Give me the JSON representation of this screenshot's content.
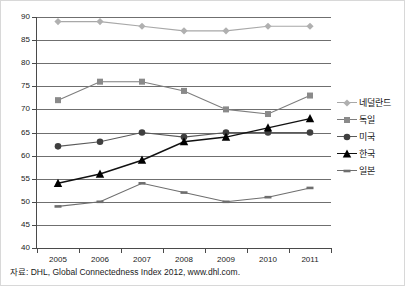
{
  "chart_data": {
    "type": "line",
    "title": "",
    "subtitle": "",
    "xlabel": "",
    "ylabel": "",
    "x": [
      2005,
      2006,
      2007,
      2008,
      2009,
      2010,
      2011
    ],
    "categories": [
      "2005",
      "2006",
      "2007",
      "2008",
      "2009",
      "2010",
      "2011"
    ],
    "ylim": [
      40,
      90
    ],
    "yticks": [
      40,
      45,
      50,
      55,
      60,
      65,
      70,
      75,
      80,
      85,
      90
    ],
    "ytick_labels": [
      "40",
      "45",
      "50",
      "55",
      "60",
      "65",
      "70",
      "75",
      "80",
      "85",
      "90"
    ],
    "grid": true,
    "legend_position": "right",
    "series": [
      {
        "name": "네덜란드",
        "values": [
          89,
          89,
          88,
          87,
          87,
          88,
          88
        ],
        "color": "#a8a8a8",
        "marker": "diamond",
        "marker_color": "#b0b0b0"
      },
      {
        "name": "독일",
        "values": [
          72,
          76,
          76,
          74,
          70,
          69,
          73
        ],
        "color": "#7d7d7d",
        "marker": "square",
        "marker_color": "#8a8a8a"
      },
      {
        "name": "미국",
        "values": [
          62,
          63,
          65,
          64,
          65,
          65,
          65
        ],
        "color": "#5a5a5a",
        "marker": "circle",
        "marker_color": "#3f3f3f"
      },
      {
        "name": "한국",
        "values": [
          54,
          56,
          59,
          63,
          64,
          66,
          68
        ],
        "color": "#111111",
        "marker": "triangle",
        "marker_color": "#000000"
      },
      {
        "name": "일본",
        "values": [
          49,
          50,
          54,
          52,
          50,
          51,
          53
        ],
        "color": "#6e6e6e",
        "marker": "dash",
        "marker_color": "#6e6e6e"
      }
    ]
  },
  "legend": {
    "items": [
      {
        "label": "네덜란드"
      },
      {
        "label": "독일"
      },
      {
        "label": "미국"
      },
      {
        "label": "한국"
      },
      {
        "label": "일본"
      }
    ]
  },
  "source": {
    "note": "자료: DHL, Global Connectedness Index 2012, www.dhl.com."
  }
}
